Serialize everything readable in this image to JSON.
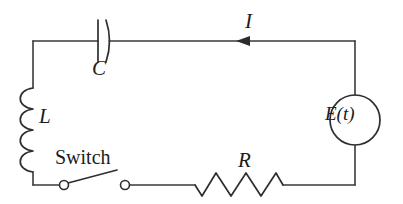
{
  "figure": {
    "name": "rlc-series-circuit-diagram",
    "kind": "electrical-circuit-schematic",
    "background_color": "#ffffff",
    "line_color": "#2e2e2e",
    "width": 403,
    "height": 204
  },
  "labels": {
    "capacitor": "C",
    "inductor": "L",
    "current": "I",
    "resistor": "R",
    "switch": "Switch",
    "source": "E(t)"
  },
  "components": [
    {
      "id": "capacitor",
      "symbol": "capacitor-symbol",
      "label": "C",
      "branch": "top",
      "orientation": "horizontal"
    },
    {
      "id": "inductor",
      "symbol": "inductor-coil-symbol",
      "label": "L",
      "branch": "left",
      "orientation": "vertical",
      "coil_count": 4
    },
    {
      "id": "switch",
      "symbol": "open-switch-symbol",
      "label": "Switch",
      "branch": "bottom",
      "state": "open",
      "terminals": 2
    },
    {
      "id": "resistor",
      "symbol": "resistor-zigzag-symbol",
      "label": "R",
      "branch": "bottom",
      "orientation": "horizontal",
      "zigzag_peaks": 3
    },
    {
      "id": "source",
      "symbol": "voltage-source-circle-symbol",
      "label": "E(t)",
      "branch": "right",
      "orientation": "vertical"
    },
    {
      "id": "current-arrow",
      "symbol": "arrow-left-icon",
      "label": "I",
      "branch": "top",
      "direction": "leftward"
    }
  ]
}
